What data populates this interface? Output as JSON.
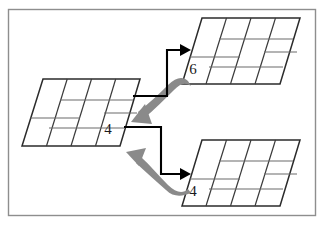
{
  "figure": {
    "background_color": "#ffffff",
    "frame": {
      "name": "outer-frame",
      "stroke_color": "#8e8e8e",
      "fill_color": "#ffffff",
      "x": 8,
      "y": 9,
      "width": 308,
      "height": 207
    },
    "colors": {
      "grid_stroke": "#2b2b2b",
      "grid_inner_stroke": "#5a5a5a",
      "grid_fill": "#ffffff",
      "black_arrow": "#000000",
      "gray_arrow": "#8a8a8a",
      "label_text": "#1a1a1a",
      "frame_stroke": "#8e8e8e"
    },
    "grids": [
      {
        "id": "center-grid",
        "name": "center-parallelogram",
        "label": "4",
        "label_x": 108,
        "label_y": 134,
        "columns": 4,
        "rows": 2,
        "skew": "right-leaning",
        "description": "Left-center parallelogram of staggered brick cells"
      },
      {
        "id": "top-grid",
        "name": "top-right-parallelogram",
        "label": "6",
        "label_x": 193,
        "label_y": 73,
        "columns": 4,
        "rows": 2,
        "skew": "right-leaning",
        "description": "Upper-right parallelogram of staggered brick cells"
      },
      {
        "id": "bottom-grid",
        "name": "bottom-right-parallelogram",
        "label": "4",
        "label_x": 193,
        "label_y": 195,
        "columns": 4,
        "rows": 2,
        "skew": "right-leaning",
        "description": "Lower-right parallelogram of staggered brick cells"
      }
    ],
    "arrows": [
      {
        "id": "black-arrow-up",
        "name": "black-arrow-center-to-top",
        "color": "#000000",
        "style": "elbow",
        "direction": "center-right then up then right",
        "head_target": "top-grid cell 6"
      },
      {
        "id": "gray-arrow-down",
        "name": "gray-arrow-top-to-center",
        "color": "#8a8a8a",
        "style": "curved-tapered",
        "direction": "from top-grid down-left to center-grid",
        "head_target": "center-grid"
      },
      {
        "id": "black-arrow-down",
        "name": "black-arrow-center-to-bottom",
        "color": "#000000",
        "style": "elbow",
        "direction": "center-right then down then right",
        "head_target": "bottom-grid cell 4"
      },
      {
        "id": "gray-arrow-up",
        "name": "gray-arrow-bottom-to-center",
        "color": "#8a8a8a",
        "style": "curved-tapered",
        "direction": "from bottom-grid up-left to center-grid",
        "head_target": "center-grid"
      }
    ]
  }
}
